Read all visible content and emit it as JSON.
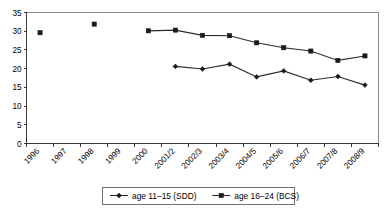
{
  "chart_data": {
    "type": "line",
    "title": "",
    "subtitle": "",
    "xlabel": "",
    "ylabel": "",
    "ylim": [
      0,
      35
    ],
    "yticks": [
      0,
      5,
      10,
      15,
      20,
      25,
      30,
      35
    ],
    "grid": false,
    "legend_position": "bottom",
    "categories": [
      "1996",
      "1997",
      "1998",
      "1999",
      "2000",
      "2001/2",
      "2002/3",
      "2003/4",
      "2004/5",
      "2005/6",
      "2006/7",
      "2007/8",
      "2008/9"
    ],
    "series": [
      {
        "name": "age 11–15 (SDD)",
        "marker": "diamond",
        "color": "#1a1a1a",
        "values": [
          null,
          null,
          null,
          null,
          null,
          20.6,
          19.9,
          21.2,
          17.8,
          19.4,
          16.9,
          17.9,
          15.6
        ]
      },
      {
        "name": "age 16–24 (BCS)",
        "marker": "square",
        "color": "#1a1a1a",
        "values": [
          29.6,
          null,
          31.9,
          null,
          30.1,
          30.3,
          28.9,
          28.8,
          26.9,
          25.6,
          24.7,
          22.2,
          23.4
        ]
      }
    ]
  },
  "axes": {
    "y_tick_labels": [
      "0",
      "5",
      "10",
      "15",
      "20",
      "25",
      "30",
      "35"
    ],
    "x_tick_labels": [
      "1996",
      "1997",
      "1998",
      "1999",
      "2000",
      "2001/2",
      "2002/3",
      "2003/4",
      "2004/5",
      "2005/6",
      "2006/7",
      "2007/8",
      "2008/9"
    ]
  },
  "legend": {
    "items": [
      {
        "label": "age 11–15 (SDD)",
        "marker": "diamond-marker-icon"
      },
      {
        "label": "age 16–24 (BCS)",
        "marker": "square-marker-icon"
      }
    ]
  }
}
